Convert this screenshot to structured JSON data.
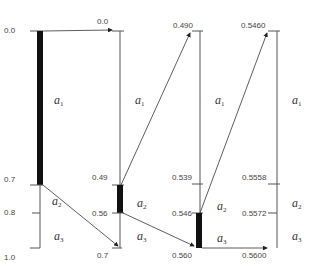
{
  "diagram": {
    "title": "",
    "symbols": [
      "a1",
      "a2",
      "a3"
    ],
    "axes": [
      {
        "id": "axis-1",
        "top_label": "0.0",
        "ticks": [
          {
            "label": "0.0",
            "y": 31
          },
          {
            "label": "0.7",
            "y": 185
          },
          {
            "label": "0.8",
            "y": 213
          },
          {
            "label": "1.0",
            "y": 248
          }
        ],
        "interval_labels": [
          "a",
          "a",
          "a"
        ],
        "interval_subs": [
          "1",
          "2",
          "3"
        ],
        "selected": "a1"
      },
      {
        "id": "axis-2",
        "ticks": [
          {
            "label": "0.0",
            "y": 31
          },
          {
            "label": "0.49",
            "y": 185
          },
          {
            "label": "0.56",
            "y": 213
          },
          {
            "label": "0.7",
            "y": 248
          }
        ],
        "interval_labels": [
          "a",
          "a",
          "a"
        ],
        "interval_subs": [
          "1",
          "2",
          "3"
        ],
        "selected": "a2"
      },
      {
        "id": "axis-3",
        "ticks": [
          {
            "label": "0.490",
            "y": 31
          },
          {
            "label": "0.539",
            "y": 184
          },
          {
            "label": "0.546",
            "y": 213
          },
          {
            "label": "0.560",
            "y": 248
          }
        ],
        "interval_labels": [
          "a",
          "a",
          "a"
        ],
        "interval_subs": [
          "1",
          "2",
          "3"
        ],
        "selected": "a3"
      },
      {
        "id": "axis-4",
        "ticks": [
          {
            "label": "0.5460",
            "y": 31
          },
          {
            "label": "0.5558",
            "y": 184
          },
          {
            "label": "0.5572",
            "y": 213
          },
          {
            "label": "0.5600",
            "y": 248
          }
        ],
        "interval_labels": [
          "a",
          "a",
          "a"
        ],
        "interval_subs": [
          "1",
          "2",
          "3"
        ]
      }
    ],
    "colors": {
      "line": "#555555",
      "bar": "#111111",
      "text": "#444444"
    }
  }
}
